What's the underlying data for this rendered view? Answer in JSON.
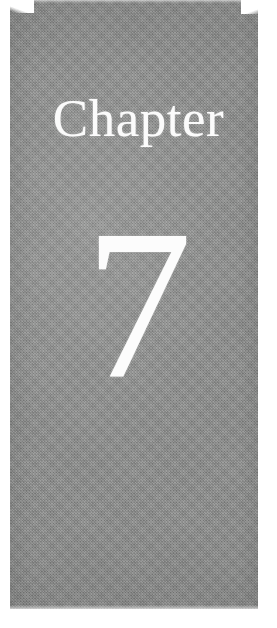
{
  "page": {
    "kind": "book-chapter-divider",
    "background_color": "#ffffff"
  },
  "panel": {
    "background_color": "#8d8e8d",
    "texture": "halftone-scan"
  },
  "heading": {
    "label": "Chapter",
    "color": "#fbfbfb"
  },
  "number": {
    "value": "7",
    "color": "#fcfcfc"
  }
}
